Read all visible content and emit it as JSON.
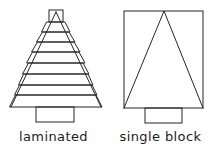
{
  "figure": {
    "type": "technical-line-drawing",
    "width": 214,
    "height": 154,
    "background_color": "#ffffff",
    "line_color": "#262626",
    "panels": [
      {
        "id": "laminated",
        "caption": "laminated",
        "description": "Stepped stack of laminations approximating a triangular profile, mounted on a base block",
        "lamination_count": 9,
        "apex_x": 56,
        "base_y": 107,
        "top_y": 10,
        "half_width_bottom": 41,
        "base_block": {
          "x": 36,
          "y": 107,
          "width": 38,
          "height": 15
        },
        "layers": [
          {
            "index": 0,
            "top_y": 10,
            "bottom_y": 22,
            "top_half_width": 7,
            "bottom_half_width": 7
          },
          {
            "index": 1,
            "top_y": 22,
            "bottom_y": 32,
            "top_half_width": 9,
            "bottom_half_width": 14
          },
          {
            "index": 2,
            "top_y": 32,
            "bottom_y": 42,
            "top_half_width": 13,
            "bottom_half_width": 19
          },
          {
            "index": 3,
            "top_y": 42,
            "bottom_y": 52,
            "top_half_width": 18,
            "bottom_half_width": 24
          },
          {
            "index": 4,
            "top_y": 52,
            "bottom_y": 63,
            "top_half_width": 23,
            "bottom_half_width": 29
          },
          {
            "index": 5,
            "top_y": 63,
            "bottom_y": 74,
            "top_half_width": 27,
            "bottom_half_width": 33
          },
          {
            "index": 6,
            "top_y": 74,
            "bottom_y": 85,
            "top_half_width": 32,
            "bottom_half_width": 37
          },
          {
            "index": 7,
            "top_y": 85,
            "bottom_y": 95,
            "top_half_width": 36,
            "bottom_half_width": 41
          },
          {
            "index": 8,
            "top_y": 95,
            "bottom_y": 107,
            "top_half_width": 40,
            "bottom_half_width": 46
          }
        ]
      },
      {
        "id": "single-block",
        "caption": "single block",
        "description": "Solid rectangular block with inscribed triangle outline, mounted on a base block",
        "block": {
          "x": 124,
          "y": 11,
          "width": 79,
          "height": 97
        },
        "triangle": {
          "apex_x": 164,
          "apex_y": 11,
          "left_x": 124,
          "right_x": 203,
          "base_y": 108
        },
        "base_block": {
          "x": 145,
          "y": 108,
          "width": 37,
          "height": 15
        }
      }
    ]
  }
}
